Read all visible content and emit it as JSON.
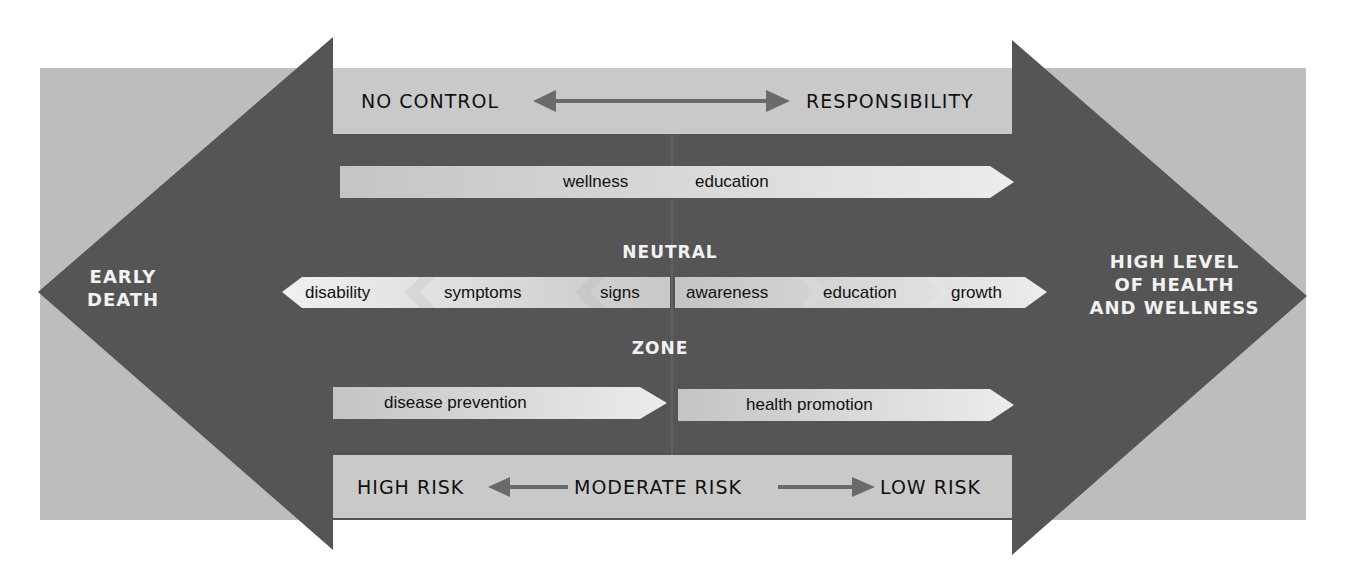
{
  "diagram": {
    "left_end": {
      "line1": "EARLY",
      "line2": "DEATH"
    },
    "right_end": {
      "line1": "HIGH LEVEL",
      "line2": "OF HEALTH",
      "line3": "AND WELLNESS"
    },
    "top_band": {
      "left": "NO CONTROL",
      "right": "RESPONSIBILITY"
    },
    "wellness_arrow": {
      "word1": "wellness",
      "word2": "education"
    },
    "neutral_zone": {
      "line1": "NEUTRAL",
      "line2": "ZONE"
    },
    "left_chain": [
      "disability",
      "symptoms",
      "signs"
    ],
    "right_chain": [
      "awareness",
      "education",
      "growth"
    ],
    "prevention": {
      "left": "disease prevention",
      "right": "health promotion"
    },
    "bottom_band": {
      "left": "HIGH RISK",
      "middle": "MODERATE RISK",
      "right": "LOW RISK"
    }
  },
  "colors": {
    "background_panel": "#bdbdbd",
    "dark_arrow": "#555555",
    "light_band": "#c8c8c8",
    "label_arrow": "#e0e0e0",
    "white_text": "#f2f2f2"
  }
}
